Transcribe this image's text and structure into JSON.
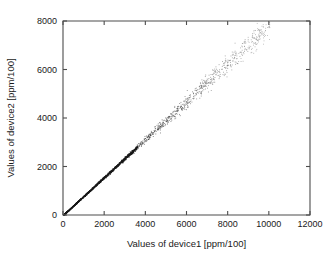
{
  "chart_data": {
    "type": "scatter",
    "title": "",
    "subtitle": "",
    "xlabel": "Values of device1 [ppm/100]",
    "ylabel": "Values of device2 [ppm/100]",
    "xlim": [
      0,
      12000
    ],
    "ylim": [
      0,
      8000
    ],
    "xticks": [
      0,
      2000,
      4000,
      6000,
      8000,
      10000,
      12000
    ],
    "yticks": [
      0,
      2000,
      4000,
      6000,
      8000
    ],
    "xtick_labels": [
      "0",
      "2000",
      "4000",
      "6000",
      "8000",
      "10000",
      "12000"
    ],
    "ytick_labels": [
      "0",
      "2000",
      "4000",
      "6000",
      "8000"
    ],
    "grid": false,
    "legend": null,
    "legend_position": "none",
    "marker": "dot",
    "marker_color": "#1a1a1a",
    "point_count": 1400,
    "relationship": "near-identity linear, y approximately equal to 0.78x with spread growing at higher values",
    "series": [
      {
        "name": "device1 vs device2",
        "x": [
          40,
          75,
          110,
          150,
          190,
          230,
          270,
          310,
          350,
          390,
          430,
          470,
          510,
          550,
          590,
          630,
          670,
          710,
          750,
          790,
          830,
          870,
          910,
          950,
          990,
          1030,
          1070,
          1110,
          1150,
          1190,
          1230,
          1270,
          1310,
          1350,
          1390,
          1430,
          1470,
          1510,
          1550,
          1590,
          1630,
          1670,
          1710,
          1750,
          1790,
          1830,
          1870,
          1910,
          1950,
          1990,
          2030,
          2070,
          2110,
          2150,
          2190,
          2230,
          2270,
          2310,
          2350,
          2390,
          2430,
          2470,
          2510,
          2550,
          2590,
          2630,
          2670,
          2710,
          2750,
          2790,
          2830,
          2870,
          2910,
          2950,
          2990,
          3030,
          3070,
          3110,
          3150,
          3190,
          3230,
          3270,
          3310,
          3350,
          3390,
          3430,
          3470,
          3510,
          3550,
          3590,
          3630,
          3670,
          3710,
          3750,
          3790,
          3830,
          3870,
          3910,
          3950,
          3990,
          4030,
          4070,
          4110,
          4150,
          4190,
          4230,
          4270,
          4310,
          4350,
          4390,
          4430,
          4470,
          4510,
          4550,
          4590,
          4630,
          4670,
          4710,
          4750,
          4790,
          4830,
          4870,
          4910,
          4950,
          4990,
          5030,
          5070,
          5110,
          5150,
          5190,
          5230,
          5270,
          5310,
          5350,
          5390,
          5430,
          5470,
          5510,
          5550,
          5590,
          5630,
          5670,
          5710,
          5750,
          5790,
          5830,
          5870,
          5910,
          5950,
          5990,
          6030,
          6070,
          6110,
          6150,
          6190,
          6230,
          6270,
          6310,
          6350,
          6390,
          6430,
          6470,
          6510,
          6550,
          6590,
          6630,
          6670,
          6710,
          6750,
          6790,
          6830,
          6870,
          6910,
          6950,
          6990,
          7030,
          7070,
          7110,
          7150,
          7190,
          7230,
          7270,
          7310,
          7350,
          7390,
          7430,
          7470,
          7510,
          7550,
          7590,
          7630,
          7670,
          7710,
          7750,
          7790,
          7830,
          7870,
          7910,
          7950,
          7990,
          8030,
          8070,
          8110,
          8150,
          8190,
          8230,
          8270,
          8310,
          8350,
          8390,
          8430,
          8470,
          8510,
          8550,
          8590,
          8630,
          8670,
          8710,
          8750,
          8790,
          8830,
          8870,
          8910,
          8950,
          8990,
          9030,
          9070,
          9110,
          9150,
          9190,
          9230,
          9270,
          9310,
          9350,
          9390,
          9430,
          9470,
          9510,
          9550,
          9590,
          9630,
          9670,
          9710,
          9750,
          9790,
          9830,
          9870,
          9910,
          9950,
          9990
        ],
        "y_ratio_mean": 0.78,
        "noise_profile": "proportional, sigma grows from 0 at x=0 to about 260 at x=10000"
      }
    ]
  },
  "figure": {
    "background_color": "#ffffff",
    "frame_color": "#4d4d4d",
    "text_color": "#1a1a1a"
  }
}
